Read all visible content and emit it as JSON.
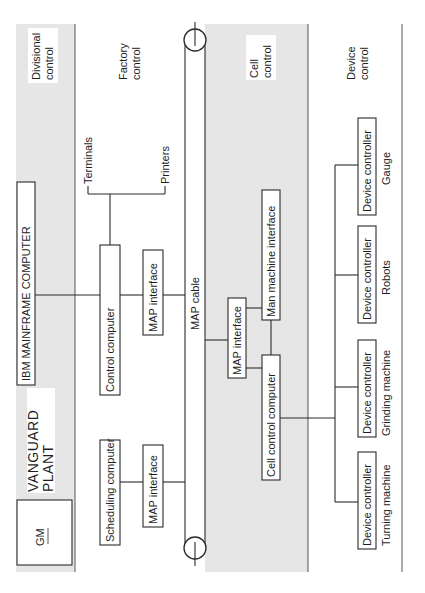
{
  "diagram": {
    "orientation": "rotated-90-ccw",
    "levels": {
      "divisional": "Divisional control",
      "divisional_l1": "Divisional",
      "divisional_l2": "control",
      "factory_l1": "Factory",
      "factory_l2": "control",
      "cell_l1": "Cell",
      "cell_l2": "control",
      "device_l1": "Device",
      "device_l2": "control"
    },
    "logo": {
      "company": "GM",
      "plant_l1": "VANGUARD",
      "plant_l2": "PLANT"
    },
    "mainframe": "IBM MAINFRAME COMPUTER",
    "factory": {
      "control_computer": "Control computer",
      "control_map_interface": "MAP interface",
      "scheduling_computer": "Scheduling computer",
      "scheduling_map_interface": "MAP interface",
      "terminals": "Terminals",
      "printers": "Printers"
    },
    "cable": "MAP cable",
    "cell": {
      "map_interface": "MAP interface",
      "man_machine_interface": "Man machine interface",
      "cell_control_computer": "Cell control computer"
    },
    "devices": [
      {
        "box": "Device controller",
        "label": "Gauge"
      },
      {
        "box": "Device controller",
        "label": "Robots"
      },
      {
        "box": "Device controller",
        "label": "Grinding machine"
      },
      {
        "box": "Device controller",
        "label": "Turning machine"
      }
    ],
    "colors": {
      "band": "#e6e6e6",
      "line": "#2a2a2a",
      "background": "#ffffff"
    }
  }
}
